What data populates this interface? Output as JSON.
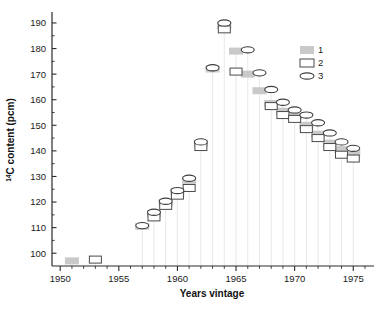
{
  "chart_data": {
    "type": "bar",
    "title": "",
    "xlabel": "Years vintage",
    "ylabel": "14C content (pcm)",
    "ylabel_prefix_sup": "14",
    "ylabel_rest": "C content  (pcm)",
    "xlim": [
      1949.3,
      1976.6
    ],
    "ylim": [
      95.0,
      193.5
    ],
    "grid": false,
    "legend_position": "top-right",
    "y_ticks": [
      100,
      110,
      120,
      130,
      140,
      150,
      160,
      170,
      180,
      190
    ],
    "x_ticks": [
      1950,
      1955,
      1960,
      1965,
      1970,
      1975
    ],
    "x_minor_step": 1,
    "series": [
      {
        "name": "1",
        "marker": "filled-rect",
        "color": "#c9c9c9",
        "x": [
          1951,
          1957,
          1958,
          1959,
          1960,
          1961,
          1962,
          1963,
          1964,
          1965,
          1966,
          1967,
          1968,
          1969,
          1970,
          1971,
          1972,
          1973,
          1974,
          1975
        ],
        "values": [
          97.0,
          110.5,
          115.5,
          119.8,
          124.0,
          128.5,
          143.0,
          172.0,
          189.0,
          179.0,
          170.0,
          163.5,
          158.5,
          155.5,
          153.5,
          150.0,
          146.5,
          143.0,
          140.5,
          139.0
        ]
      },
      {
        "name": "2",
        "marker": "open-rect",
        "color": "#ffffff",
        "x": [
          1953,
          1958,
          1959,
          1960,
          1961,
          1962,
          1964,
          1965,
          1968,
          1969,
          1970,
          1971,
          1972,
          1973,
          1974,
          1975
        ],
        "values": [
          97.5,
          114.0,
          118.5,
          122.5,
          125.5,
          141.5,
          187.5,
          171.0,
          157.5,
          154.0,
          152.5,
          148.5,
          145.0,
          141.5,
          138.5,
          137.0
        ]
      },
      {
        "name": "3",
        "marker": "ellipse",
        "color": "#ffffff",
        "x": [
          1957,
          1958,
          1959,
          1960,
          1961,
          1962,
          1963,
          1964,
          1966,
          1967,
          1968,
          1969,
          1970,
          1971,
          1972,
          1973,
          1974,
          1975
        ],
        "values": [
          110.8,
          116.0,
          120.3,
          124.5,
          129.3,
          143.5,
          172.5,
          190.0,
          179.5,
          170.5,
          164.0,
          159.0,
          156.0,
          154.0,
          151.0,
          147.0,
          143.5,
          141.0
        ]
      }
    ]
  },
  "legend": {
    "items": [
      {
        "label": "1",
        "marker": "filled-rect"
      },
      {
        "label": "2",
        "marker": "open-rect"
      },
      {
        "label": "3",
        "marker": "ellipse"
      }
    ]
  },
  "axes": {
    "x_title": "Years vintage",
    "y_title_sup": "14",
    "y_title_main": "C content  (pcm)",
    "x_tick_labels": [
      "1950",
      "1955",
      "1960",
      "1965",
      "1970",
      "1975"
    ],
    "y_tick_labels": [
      "100",
      "110",
      "120",
      "130",
      "140",
      "150",
      "160",
      "170",
      "180",
      "190"
    ]
  }
}
